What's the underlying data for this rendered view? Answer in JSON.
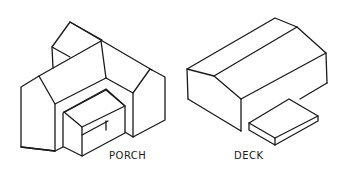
{
  "figures": [
    {
      "id": "porch",
      "label": "PORCH",
      "description": "Isometric sketch of a house with a cross-gable and a box-shaped porch projecting from the front gable"
    },
    {
      "id": "deck",
      "label": "DECK",
      "description": "Isometric sketch of a gabled house with a low flat deck slab attached to the long side"
    }
  ],
  "colors": {
    "line": "#1a1a1a",
    "background": "#ffffff"
  }
}
